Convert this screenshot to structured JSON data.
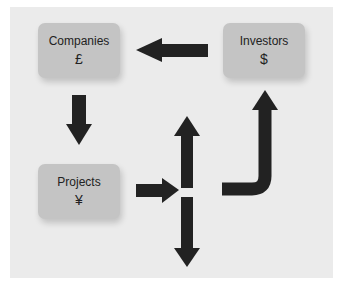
{
  "diagram": {
    "nodes": [
      {
        "id": "companies",
        "label": "Companies",
        "symbol": "£"
      },
      {
        "id": "investors",
        "label": "Investors",
        "symbol": "$"
      },
      {
        "id": "projects",
        "label": "Projects",
        "symbol": "¥"
      }
    ],
    "edges": [
      {
        "from": "investors",
        "to": "companies"
      },
      {
        "from": "companies",
        "to": "projects"
      },
      {
        "from": "projects",
        "to": "split-up-down"
      },
      {
        "from": "split-up-down",
        "to": "investors"
      }
    ],
    "colors": {
      "background": "#ebebeb",
      "node_fill": "#c4c4c4",
      "arrow": "#222222"
    }
  }
}
